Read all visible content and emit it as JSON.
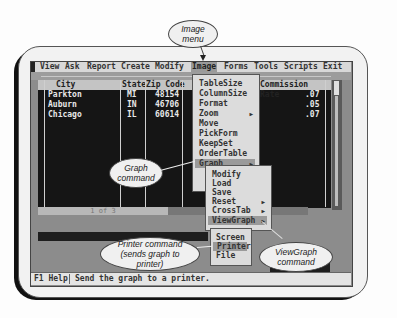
{
  "menubar": {
    "items": [
      "View",
      "Ask",
      "Report",
      "Create",
      "Modify",
      "Image",
      "Forms",
      "Tools",
      "Scripts",
      "Exit"
    ],
    "selected": "Image"
  },
  "table": {
    "columns": [
      "City",
      "State",
      "Zip Code",
      "Commission Rate"
    ],
    "rows": [
      {
        "city": "Parkton",
        "state": "MI",
        "zip": "48154",
        "rate": ".07"
      },
      {
        "city": "Auburn",
        "state": "IN",
        "zip": "46706",
        "rate": ".05"
      },
      {
        "city": "Chicago",
        "state": "IL",
        "zip": "60614",
        "rate": ".07"
      }
    ],
    "record_indicator": "1 of 3"
  },
  "image_menu": {
    "items": [
      {
        "label": "TableSize",
        "submenu": false
      },
      {
        "label": "ColumnSize",
        "submenu": false
      },
      {
        "label": "Format",
        "submenu": false
      },
      {
        "label": "Zoom",
        "submenu": true
      },
      {
        "label": "Move",
        "submenu": false
      },
      {
        "label": "PickForm",
        "submenu": false
      },
      {
        "label": "KeepSet",
        "submenu": false
      },
      {
        "label": "OrderTable",
        "submenu": false
      },
      {
        "label": "Graph",
        "submenu": true,
        "selected": true
      }
    ]
  },
  "graph_menu": {
    "items": [
      {
        "label": "Modify",
        "submenu": false
      },
      {
        "label": "Load",
        "submenu": false
      },
      {
        "label": "Save",
        "submenu": false
      },
      {
        "label": "Reset",
        "submenu": true
      },
      {
        "label": "CrossTab",
        "submenu": true
      },
      {
        "label": "ViewGraph",
        "submenu": true,
        "selected": true
      }
    ]
  },
  "viewgraph_menu": {
    "items": [
      {
        "label": "Screen"
      },
      {
        "label": "Printer",
        "selected": true
      },
      {
        "label": "File"
      }
    ]
  },
  "status": {
    "key": "F1 Help",
    "message": "Send the graph to a printer."
  },
  "callouts": {
    "image_menu": "Image menu",
    "graph_command": "Graph command",
    "printer_command": "Printer command (sends graph to printer)",
    "viewgraph_command": "ViewGraph command"
  },
  "icons": {
    "submenu_arrow": "▶"
  }
}
